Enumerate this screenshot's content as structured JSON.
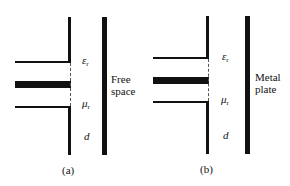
{
  "panels": [
    {
      "id": "a",
      "caption": "(a)",
      "symbols": {
        "epsilon": "ε",
        "epsilon_sub": "r",
        "mu": "μ",
        "mu_sub": "r",
        "thickness": "d"
      },
      "medium_label_line1": "Free",
      "medium_label_line2": "space"
    },
    {
      "id": "b",
      "caption": "(b)",
      "symbols": {
        "epsilon": "ε",
        "epsilon_sub": "r",
        "mu": "μ",
        "mu_sub": "r",
        "thickness": "d"
      },
      "medium_label_line1": "Metal",
      "medium_label_line2": "plate"
    }
  ]
}
